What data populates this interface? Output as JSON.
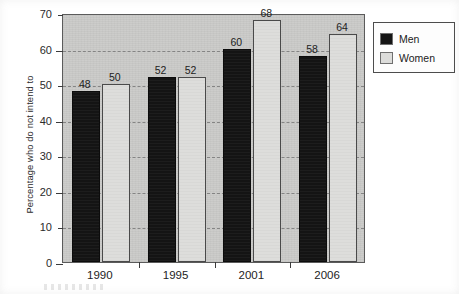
{
  "chart_data": {
    "type": "bar",
    "title": "",
    "subtitle": "",
    "xlabel": "",
    "ylabel": "Percentage who do not intend to",
    "categories": [
      "1990",
      "1995",
      "2001",
      "2006"
    ],
    "series": [
      {
        "name": "Men",
        "color": "#151515",
        "values": [
          48,
          52,
          60,
          58
        ]
      },
      {
        "name": "Women",
        "color": "#dcdcda",
        "values": [
          50,
          52,
          68,
          64
        ]
      }
    ],
    "ylim": [
      0,
      70
    ],
    "ytick_values": [
      0,
      10,
      20,
      30,
      40,
      50,
      60,
      70
    ],
    "ytick_labels": [
      "0",
      "10",
      "20",
      "30",
      "40",
      "50",
      "60",
      "70"
    ],
    "gridlines": {
      "on": true,
      "axis": "y",
      "values": [
        10,
        20,
        30,
        40,
        50,
        60
      ],
      "style": "dashed"
    },
    "data_labels": {
      "on": true,
      "values": [
        "48",
        "50",
        "52",
        "52",
        "60",
        "68",
        "58",
        "64"
      ]
    },
    "legend": {
      "position": "right-top",
      "entries": [
        {
          "label": "Men",
          "swatch": "black-square-icon"
        },
        {
          "label": "Women",
          "swatch": "light-gray-square-icon"
        }
      ]
    },
    "plot_background": "#c9c9c7",
    "axis_color": "#3b3b3b"
  },
  "legend_box": {
    "entries": [
      {
        "label": "Men"
      },
      {
        "label": "Women"
      }
    ]
  }
}
